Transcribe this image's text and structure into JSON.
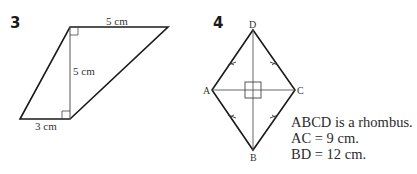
{
  "figure3": {
    "number": "3",
    "top_label": "5 cm",
    "height_label": "5 cm",
    "bottom_label": "3 cm",
    "shape": "parallelogram",
    "vertices": {
      "top_left": [
        70,
        27
      ],
      "top_right": [
        168,
        27
      ],
      "bottom_left": [
        20,
        119
      ],
      "bottom_right": [
        70,
        119
      ]
    }
  },
  "figure4": {
    "number": "4",
    "vertex_labels": {
      "A": "A",
      "B": "B",
      "C": "C",
      "D": "D"
    },
    "shape": "rhombus",
    "vertices": {
      "A": [
        212,
        90
      ],
      "B": [
        253,
        150
      ],
      "C": [
        295,
        90
      ],
      "D": [
        253,
        30
      ]
    },
    "notes": [
      "ABCD is a rhombus.",
      "AC = 9 cm.",
      "BD = 12 cm."
    ]
  },
  "colors": {
    "stroke": "#1a1a1a",
    "thin_stroke": "#444444",
    "text": "#2a2a2a",
    "background": "#ffffff"
  }
}
